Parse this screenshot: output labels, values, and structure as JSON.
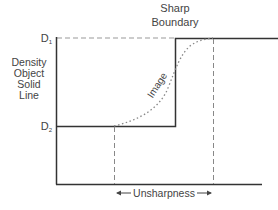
{
  "title": {
    "line1": "Sharp",
    "line2": "Boundary"
  },
  "y_axis": {
    "label_lines": [
      "Density",
      "Object",
      "Solid",
      "Line"
    ],
    "levels": {
      "d1": {
        "letter": "D",
        "subscript": "1"
      },
      "d2": {
        "letter": "D",
        "subscript": "2"
      }
    }
  },
  "curve_label": "Image",
  "unsharpness_label": "Unsharpness",
  "colors": {
    "solid_line": "#333333",
    "dashed_line": "#888888",
    "text": "#444444",
    "background": "#ffffff"
  }
}
